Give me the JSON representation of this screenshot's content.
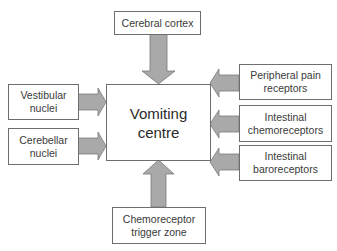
{
  "diagram": {
    "center": {
      "label": "Vomiting\ncentre"
    },
    "inputs": {
      "top": {
        "label": "Cerebral cortex"
      },
      "left_1": {
        "label": "Vestibular\nnuclei"
      },
      "left_2": {
        "label": "Cerebellar\nnuclei"
      },
      "right_1": {
        "label": "Peripheral pain\nreceptors"
      },
      "right_2": {
        "label": "Intestinal\nchemoreceptors"
      },
      "right_3": {
        "label": "Intestinal\nbaroreceptors"
      },
      "bottom": {
        "label": "Chemoreceptor\ntrigger zone"
      }
    },
    "colors": {
      "arrow_fill": "#a9a9a9",
      "arrow_stroke": "#7a7a7a",
      "box_border": "#6e6e6e",
      "text": "#3a3a3a"
    }
  }
}
